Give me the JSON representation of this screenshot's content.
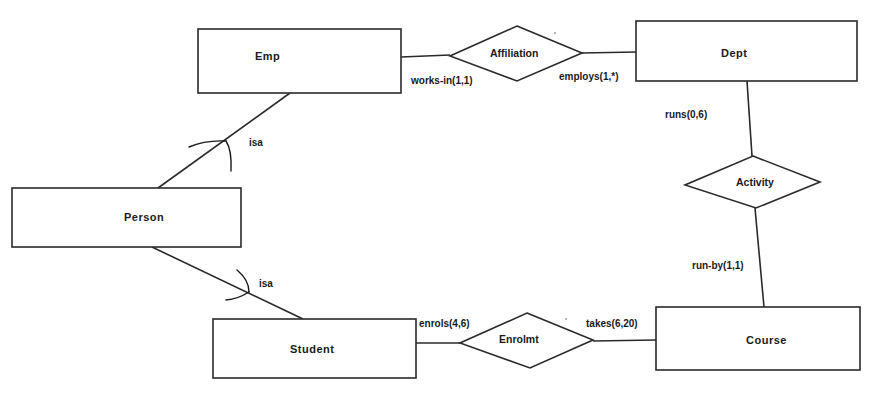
{
  "diagram": {
    "type": "ER diagram",
    "entities": [
      {
        "id": "emp",
        "label": "Emp"
      },
      {
        "id": "dept",
        "label": "Dept"
      },
      {
        "id": "person",
        "label": "Person"
      },
      {
        "id": "student",
        "label": "Student"
      },
      {
        "id": "course",
        "label": "Course"
      }
    ],
    "relationships": [
      {
        "id": "affiliation",
        "label": "Affiliation",
        "between": [
          "Emp",
          "Dept"
        ]
      },
      {
        "id": "activity",
        "label": "Activity",
        "between": [
          "Dept",
          "Course"
        ]
      },
      {
        "id": "enrolmt",
        "label": "Enrolmt",
        "between": [
          "Student",
          "Course"
        ]
      }
    ],
    "cardinalities": {
      "works_in": "works-in(1,1)",
      "employs": "employs(1,*)",
      "runs": "runs(0,6)",
      "run_by": "run-by(1,1)",
      "enrols": "enrols(4,6)",
      "takes": "takes(6,20)"
    },
    "isa_links": [
      {
        "label": "isa",
        "from": "Emp",
        "to": "Person"
      },
      {
        "label": "isa",
        "from": "Student",
        "to": "Person"
      }
    ]
  }
}
